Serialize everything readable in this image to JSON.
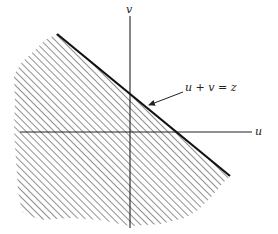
{
  "diagram": {
    "axes": {
      "horizontal_label": "u",
      "vertical_label": "v"
    },
    "line_label": "u + v = z",
    "region": "shaded half-plane u + v ≤ z (below-left of the line)",
    "colors": {
      "ink": "#222222",
      "hatch": "#555555",
      "background": "#ffffff"
    }
  }
}
